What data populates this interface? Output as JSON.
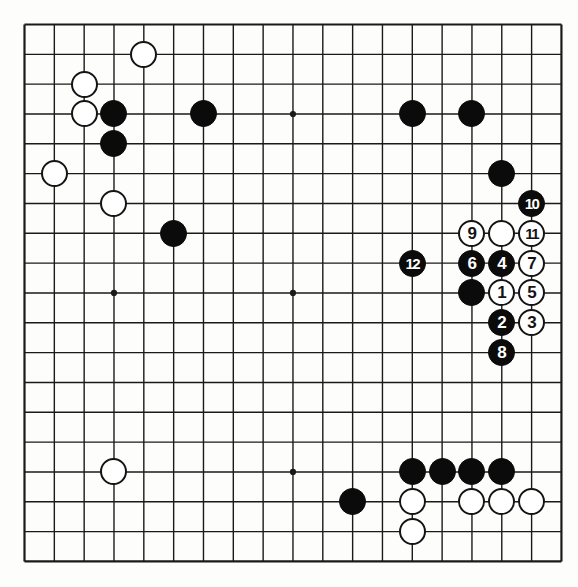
{
  "diagram": {
    "type": "go-board-position",
    "board_size": 19,
    "grid": {
      "origin_x": 24.5,
      "origin_y": 24.5,
      "spacing": 29.83,
      "line_color": "#1a1a1a",
      "border_width": 2.2,
      "inner_width": 1.4,
      "background": "#fdfdfb"
    },
    "star_points": [
      {
        "col": 4,
        "row": 4
      },
      {
        "col": 10,
        "row": 4
      },
      {
        "col": 16,
        "row": 4
      },
      {
        "col": 4,
        "row": 10
      },
      {
        "col": 10,
        "row": 10
      },
      {
        "col": 16,
        "row": 10
      },
      {
        "col": 4,
        "row": 16
      },
      {
        "col": 10,
        "row": 16
      },
      {
        "col": 16,
        "row": 16
      }
    ],
    "colors": {
      "black_stone": "#0b0b0b",
      "white_stone": "#ffffff",
      "stone_outline": "#141414",
      "black_label": "#ffffff",
      "white_label": "#141414"
    },
    "stone_diameter": 27,
    "stones": [
      {
        "col": 5,
        "row": 2,
        "color": "white",
        "label": ""
      },
      {
        "col": 3,
        "row": 3,
        "color": "white",
        "label": ""
      },
      {
        "col": 3,
        "row": 4,
        "color": "white",
        "label": ""
      },
      {
        "col": 4,
        "row": 4,
        "color": "black",
        "label": ""
      },
      {
        "col": 7,
        "row": 4,
        "color": "black",
        "label": ""
      },
      {
        "col": 14,
        "row": 4,
        "color": "black",
        "label": ""
      },
      {
        "col": 16,
        "row": 4,
        "color": "black",
        "label": ""
      },
      {
        "col": 4,
        "row": 5,
        "color": "black",
        "label": ""
      },
      {
        "col": 2,
        "row": 6,
        "color": "white",
        "label": ""
      },
      {
        "col": 17,
        "row": 6,
        "color": "black",
        "label": ""
      },
      {
        "col": 4,
        "row": 7,
        "color": "white",
        "label": ""
      },
      {
        "col": 18,
        "row": 7,
        "color": "black",
        "label": "10"
      },
      {
        "col": 6,
        "row": 8,
        "color": "black",
        "label": ""
      },
      {
        "col": 16,
        "row": 8,
        "color": "white",
        "label": "9"
      },
      {
        "col": 17,
        "row": 8,
        "color": "white",
        "label": ""
      },
      {
        "col": 18,
        "row": 8,
        "color": "white",
        "label": "11"
      },
      {
        "col": 14,
        "row": 9,
        "color": "black",
        "label": "12"
      },
      {
        "col": 16,
        "row": 9,
        "color": "black",
        "label": "6"
      },
      {
        "col": 17,
        "row": 9,
        "color": "black",
        "label": "4"
      },
      {
        "col": 18,
        "row": 9,
        "color": "white",
        "label": "7"
      },
      {
        "col": 16,
        "row": 10,
        "color": "black",
        "label": ""
      },
      {
        "col": 17,
        "row": 10,
        "color": "white",
        "label": "1"
      },
      {
        "col": 18,
        "row": 10,
        "color": "white",
        "label": "5"
      },
      {
        "col": 17,
        "row": 11,
        "color": "black",
        "label": "2"
      },
      {
        "col": 18,
        "row": 11,
        "color": "white",
        "label": "3"
      },
      {
        "col": 17,
        "row": 12,
        "color": "black",
        "label": "8"
      },
      {
        "col": 4,
        "row": 16,
        "color": "white",
        "label": ""
      },
      {
        "col": 14,
        "row": 16,
        "color": "black",
        "label": ""
      },
      {
        "col": 15,
        "row": 16,
        "color": "black",
        "label": ""
      },
      {
        "col": 16,
        "row": 16,
        "color": "black",
        "label": ""
      },
      {
        "col": 17,
        "row": 16,
        "color": "black",
        "label": ""
      },
      {
        "col": 12,
        "row": 17,
        "color": "black",
        "label": ""
      },
      {
        "col": 14,
        "row": 17,
        "color": "white",
        "label": ""
      },
      {
        "col": 16,
        "row": 17,
        "color": "white",
        "label": ""
      },
      {
        "col": 17,
        "row": 17,
        "color": "white",
        "label": ""
      },
      {
        "col": 18,
        "row": 17,
        "color": "white",
        "label": ""
      },
      {
        "col": 14,
        "row": 18,
        "color": "white",
        "label": ""
      }
    ],
    "move_sequence": [
      {
        "number": "1",
        "color": "white",
        "col": 17,
        "row": 10
      },
      {
        "number": "2",
        "color": "black",
        "col": 17,
        "row": 11
      },
      {
        "number": "3",
        "color": "white",
        "col": 18,
        "row": 11
      },
      {
        "number": "4",
        "color": "black",
        "col": 17,
        "row": 9
      },
      {
        "number": "5",
        "color": "white",
        "col": 18,
        "row": 10
      },
      {
        "number": "6",
        "color": "black",
        "col": 16,
        "row": 9
      },
      {
        "number": "7",
        "color": "white",
        "col": 18,
        "row": 9
      },
      {
        "number": "8",
        "color": "black",
        "col": 17,
        "row": 12
      },
      {
        "number": "9",
        "color": "white",
        "col": 16,
        "row": 8
      },
      {
        "number": "10",
        "color": "black",
        "col": 18,
        "row": 7
      },
      {
        "number": "11",
        "color": "white",
        "col": 18,
        "row": 8
      },
      {
        "number": "12",
        "color": "black",
        "col": 14,
        "row": 9
      }
    ]
  }
}
